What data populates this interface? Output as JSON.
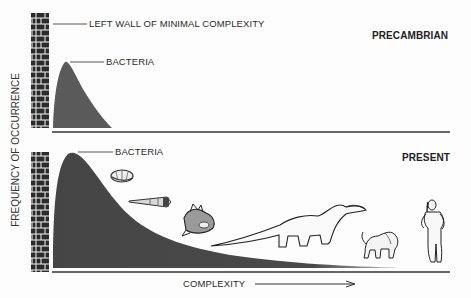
{
  "figure": {
    "y_axis_label": "FREQUENCY  OF OCCURRENCE",
    "x_axis_label": "COMPLEXITY",
    "top_panel": {
      "era_label": "PRECAMBRIAN",
      "wall_label": "LEFT WALL OF  MINIMAL COMPLEXITY",
      "peak_label": "BACTERIA"
    },
    "bottom_panel": {
      "era_label": "PRESENT",
      "peak_label": "BACTERIA",
      "organisms": [
        "trilobite",
        "nautiloid-shell",
        "fish",
        "dinosaur",
        "baboon",
        "human"
      ]
    },
    "colors": {
      "fill": "#4a4a4a",
      "axis": "#333333",
      "brick": "#2b2b2b"
    }
  }
}
